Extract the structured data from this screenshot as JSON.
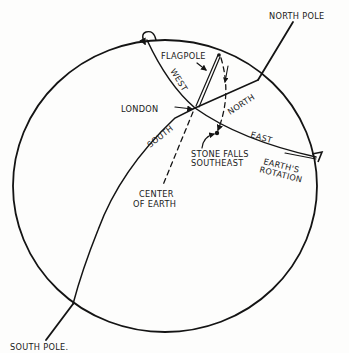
{
  "diagram": {
    "colors": {
      "ink": "#141414",
      "paper": "#fdfdfc"
    },
    "labels": {
      "north_pole": "NORTH POLE",
      "south_pole": "SOUTH POLE.",
      "flagpole": "FLAGPOLE",
      "london": "LONDON",
      "west": "WEST",
      "north": "NORTH",
      "south": "SOUTH",
      "east": "EAST",
      "stone_falls_1": "STONE FALLS",
      "stone_falls_2": "SOUTHEAST",
      "center_1": "CENTER",
      "center_2": "OF EARTH",
      "rotation_1": "EARTH'S",
      "rotation_2": "ROTATION"
    }
  }
}
